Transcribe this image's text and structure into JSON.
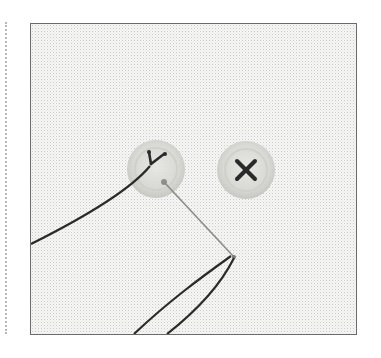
{
  "illustration": {
    "subject": "sewing-buttons-on-fabric",
    "colors": {
      "fabric": "#f6f6f4",
      "frame_border": "#6a6a6a",
      "button": "#d9d9d6",
      "button_rim": "#c4c4c0",
      "thread": "#2a2a2a",
      "needle": "#8a8a86",
      "dotted_rule": "#b8b8b8"
    },
    "elements": [
      {
        "name": "button-left",
        "stitch": "partial-y-stitch"
      },
      {
        "name": "button-right",
        "stitch": "x-stitch"
      },
      {
        "name": "needle"
      },
      {
        "name": "thread"
      }
    ]
  }
}
